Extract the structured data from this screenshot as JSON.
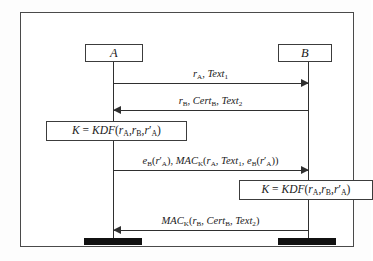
{
  "figure": {
    "type": "protocol-sequence-diagram",
    "title": "",
    "frame_border_color": "#4a4a4a",
    "line_color": "#2f2f2f",
    "terminator_color": "#111111",
    "background_color": "#ffffff"
  },
  "actors": [
    {
      "id": "A",
      "label": "A",
      "lifeline_x": 92
    },
    {
      "id": "B",
      "label": "B",
      "lifeline_x": 287
    }
  ],
  "messages": [
    {
      "id": "message-1",
      "from": "A",
      "to": "B",
      "direction": "right",
      "label": "r_A, Text_1",
      "label_parts": [
        {
          "text": "r",
          "style": "italic"
        },
        {
          "text": "A",
          "style": "sub"
        },
        {
          "text": ", ",
          "style": "roman"
        },
        {
          "text": "Text",
          "style": "italic"
        },
        {
          "text": "1",
          "style": "sub"
        }
      ]
    },
    {
      "id": "message-2",
      "from": "B",
      "to": "A",
      "direction": "left",
      "label": "r_B, Cert_B, Text_2",
      "label_parts": [
        {
          "text": "r",
          "style": "italic"
        },
        {
          "text": "B",
          "style": "sub"
        },
        {
          "text": ", ",
          "style": "roman"
        },
        {
          "text": "Cert",
          "style": "italic"
        },
        {
          "text": "B",
          "style": "sub"
        },
        {
          "text": ", ",
          "style": "roman"
        },
        {
          "text": "Text",
          "style": "italic"
        },
        {
          "text": "2",
          "style": "sub"
        }
      ]
    },
    {
      "id": "message-3",
      "from": "A",
      "to": "B",
      "direction": "right",
      "label": "e_B(r'_A), MAC_K(r_A, Text_1, e_B(r'_A))"
    },
    {
      "id": "message-4",
      "from": "B",
      "to": "A",
      "direction": "left",
      "label": "MAC_K(r_B, Cert_B, Text_2)"
    }
  ],
  "computations": [
    {
      "id": "compute-box-a",
      "actor": "A",
      "label": "K = KDF(r_A, r_B, r'_A)"
    },
    {
      "id": "compute-box-b",
      "actor": "B",
      "label": "K = KDF(r_A, r_B, r'_A)"
    }
  ],
  "terminators": [
    {
      "id": "terminator-a",
      "actor": "A"
    },
    {
      "id": "terminator-b",
      "actor": "B"
    }
  ]
}
